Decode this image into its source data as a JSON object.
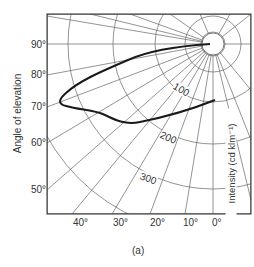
{
  "diagram": {
    "caption": "(a)",
    "y_axis_label": "Angle of elevation",
    "right_axis_label": "Intensity (cd klm⁻¹)",
    "elevation_ticks": [
      {
        "label": "90°",
        "y": 46
      },
      {
        "label": "80°",
        "y": 75
      },
      {
        "label": "70°",
        "y": 107
      },
      {
        "label": "60°",
        "y": 143
      },
      {
        "label": "50°",
        "y": 190
      }
    ],
    "azimuth_ticks": [
      {
        "label": "40°",
        "x": 80
      },
      {
        "label": "30°",
        "x": 120
      },
      {
        "label": "20°",
        "x": 157
      },
      {
        "label": "10°",
        "x": 190
      },
      {
        "label": "0°",
        "x": 217
      }
    ],
    "intensity_contours": [
      {
        "label": "100",
        "x": 178,
        "y": 92
      },
      {
        "label": "200",
        "x": 165,
        "y": 139
      },
      {
        "label": "300",
        "x": 143,
        "y": 180
      }
    ],
    "colors": {
      "grid": "#555555",
      "curve": "#1a1a1a",
      "frame": "#333333"
    }
  }
}
